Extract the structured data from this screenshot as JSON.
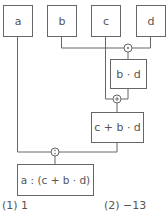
{
  "diagram": {
    "inputs": [
      {
        "id": "a",
        "label": "a"
      },
      {
        "id": "b",
        "label": "b"
      },
      {
        "id": "c",
        "label": "c"
      },
      {
        "id": "d",
        "label": "d"
      }
    ],
    "operators": [
      {
        "id": "op-mul",
        "symbol": "·",
        "inputs": [
          "b",
          "d"
        ]
      },
      {
        "id": "op-add",
        "symbol": "+",
        "inputs": [
          "c",
          "b·d"
        ]
      },
      {
        "id": "op-div",
        "symbol": ":",
        "inputs": [
          "a",
          "c+b·d"
        ]
      }
    ],
    "intermediates": [
      {
        "id": "bd",
        "label": "b · d"
      },
      {
        "id": "cbd",
        "label": "c + b · d"
      }
    ],
    "result": {
      "label": "a : (c + b · d)"
    }
  },
  "answers": [
    {
      "label": "(1)",
      "value": "1"
    },
    {
      "label": "(2)",
      "value": "−13"
    }
  ]
}
